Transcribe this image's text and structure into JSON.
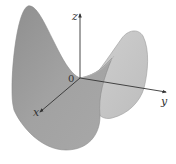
{
  "figure": {
    "axes": {
      "x_label": "x",
      "y_label": "y",
      "z_label": "z",
      "origin_label": "0"
    },
    "colors": {
      "surface_front": "#9a9a9a",
      "surface_back": "#c4c4c4",
      "surface_edge": "#7a7a7a",
      "axis": "#333333",
      "background": "#ffffff"
    }
  }
}
